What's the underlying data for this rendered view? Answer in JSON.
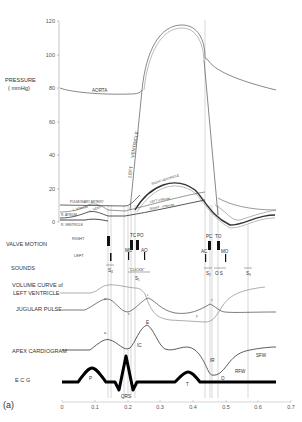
{
  "figure": {
    "panel_label": "(a)",
    "pressure_axis": {
      "label_line1": "PRESSURE",
      "label_line2": "( mmHg)",
      "ticks": [
        "120",
        "100",
        "80",
        "60",
        "40",
        "20",
        "0"
      ]
    },
    "time_axis": {
      "ticks": [
        "0",
        "0.1",
        "0.2",
        "0.3",
        "0.4",
        "0.5",
        "0.6",
        "0.7"
      ]
    },
    "pressure_curves": {
      "aorta": "AORTA",
      "left_ventricle_1": "LEFT",
      "left_ventricle_2": "VENTRICLE",
      "right_ventricle": "RIGHT VENTRICLE",
      "pulmonary_artery": "PULMONARY ARTERY",
      "l_atrium": "L. ATRIUM",
      "l_vent": "L. VENT",
      "r_atrium": "R. ATRIUM",
      "r_vent_small": "R. VENT",
      "r_ventricle": "R. VENTRICLE",
      "left_atrium": "LEFT ATRIUM",
      "right_atrium": "RIGHT · ATRIUM"
    },
    "rows": {
      "valve_motion": "VALVE MOTION",
      "right": "RIGHT",
      "left": "LEFT",
      "sounds": "SOUNDS",
      "volume_1": "VOLUME CURVE of",
      "volume_2": "LEFT VENTRICLE",
      "jugular": "JUGULAR PULSE",
      "apex": "APEX CARDIOGRAM",
      "ecg": "E C G"
    },
    "valve_labels": {
      "tc": "TC",
      "po": "PO",
      "mc": "MC",
      "ao": "AO",
      "pc": "PC",
      "to": "TO",
      "ac": "AC",
      "mo": "MO"
    },
    "sound_labels": {
      "s4": "S₄",
      "s1": "S₁",
      "clicks": "\"CLICKS\"",
      "s2": "S₂",
      "os": "O S",
      "s3": "S₃"
    },
    "wave_labels": {
      "jug_a": "a",
      "jug_c": "c",
      "jug_x": "x",
      "jug_v": "v",
      "jug_y": "y",
      "apex_a": "a",
      "apex_ic": "IC",
      "apex_e": "E",
      "apex_ir": "IR",
      "apex_o": "O",
      "apex_rfw": "RFW",
      "apex_sfw": "SFW",
      "ecg_p": "P",
      "ecg_qrs": "QRS",
      "ecg_t": "T"
    }
  }
}
